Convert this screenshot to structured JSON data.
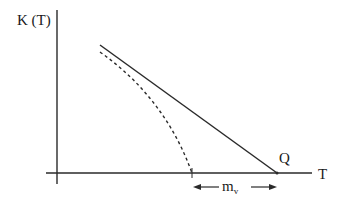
{
  "diagram": {
    "y_axis_label": "K (T)",
    "x_axis_label": "T",
    "point_label": "Q",
    "interval_label_main": "m",
    "interval_label_sub": "v",
    "colors": {
      "ink": "#2a2a2a",
      "background": "#ffffff"
    },
    "curves": [
      {
        "name": "solid-line",
        "style": "solid",
        "from": [
          100,
          45
        ],
        "to": [
          277,
          173
        ]
      },
      {
        "name": "dashed-curve",
        "style": "dashed",
        "from": [
          100,
          52
        ],
        "to": [
          192,
          173
        ]
      }
    ]
  }
}
